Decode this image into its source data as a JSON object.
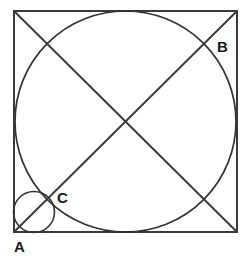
{
  "figure": {
    "background_color": "#ffffff",
    "stroke_color": "#333333",
    "label_color": "#1a1a1a"
  },
  "labels": {
    "a": "A",
    "b": "B",
    "c": "C"
  },
  "label_positions": {
    "a": {
      "x": 14,
      "y": 252
    },
    "b": {
      "x": 217,
      "y": 52
    },
    "c": {
      "x": 57,
      "y": 203
    }
  },
  "shapes": {
    "square": {
      "name": "outer-square",
      "x": 14,
      "y": 11,
      "width": 223,
      "height": 221,
      "stroke": "#3a3a3a"
    },
    "circle_large": {
      "name": "inscribed-circle",
      "cx": 125.5,
      "cy": 121.5,
      "r": 110.5,
      "stroke": "#333333"
    },
    "circle_small": {
      "name": "corner-circle",
      "cx": 34,
      "cy": 212,
      "r": 20.5,
      "stroke": "#333333"
    },
    "diagonal_1": {
      "name": "diagonal-a-to-b",
      "x1": 14,
      "y1": 232,
      "x2": 237,
      "y2": 11,
      "stroke": "#3a3a3a"
    },
    "diagonal_2": {
      "name": "diagonal-topleft-to-bottomright",
      "x1": 14,
      "y1": 11,
      "x2": 237,
      "y2": 232,
      "stroke": "#3a3a3a"
    }
  },
  "chart_data": {
    "type": "diagram",
    "elements": [
      {
        "kind": "square",
        "id": "outer-square",
        "corners": [
          [
            14,
            11
          ],
          [
            237,
            11
          ],
          [
            237,
            232
          ],
          [
            14,
            232
          ]
        ],
        "side_length_px": 222
      },
      {
        "kind": "circle",
        "id": "inscribed-circle",
        "center": [
          125.5,
          121.5
        ],
        "radius_px": 110.5,
        "note": "inscribed in square, tangent to all four sides"
      },
      {
        "kind": "circle",
        "id": "corner-circle",
        "center": [
          34,
          212
        ],
        "radius_px": 20.5,
        "note": "small circle in bottom-left corner, tangent to left and bottom sides and to the inscribed circle"
      },
      {
        "kind": "line",
        "id": "diagonal-a-to-b",
        "from": [
          14,
          232
        ],
        "to": [
          237,
          11
        ]
      },
      {
        "kind": "line",
        "id": "diagonal-topleft-to-bottomright",
        "from": [
          14,
          11
        ],
        "to": [
          237,
          232
        ]
      },
      {
        "kind": "point-label",
        "id": "point-a",
        "label": "A",
        "at": [
          14,
          232
        ],
        "note": "bottom-left corner of square"
      },
      {
        "kind": "point-label",
        "id": "point-b",
        "label": "B",
        "at": [
          203,
          44
        ],
        "note": "intersection of diagonal with inscribed circle near top-right"
      },
      {
        "kind": "point-label",
        "id": "point-c",
        "label": "C",
        "at": [
          50,
          196
        ],
        "note": "intersection of diagonal with small corner circle and inscribed circle"
      }
    ]
  }
}
